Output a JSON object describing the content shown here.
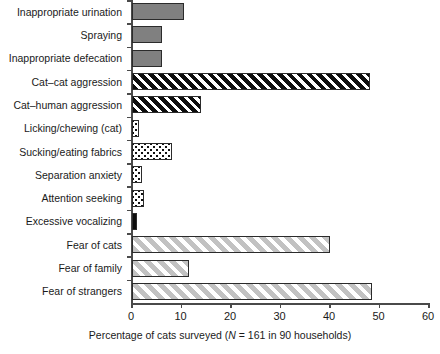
{
  "chart_data": {
    "type": "bar",
    "orientation": "horizontal",
    "title": "",
    "xlabel_prefix": "Percentage of cats surveyed (",
    "xlabel_italic": "N",
    "xlabel_suffix": " = 161 in 90 households)",
    "xlabel_full": "Percentage of cats surveyed (N = 161 in 90 households)",
    "ylabel": "",
    "xlim": [
      0,
      60
    ],
    "xticks": [
      0,
      10,
      20,
      30,
      40,
      50,
      60
    ],
    "xtick_labels": [
      "0",
      "10",
      "20",
      "30",
      "40",
      "50",
      "60"
    ],
    "grid": false,
    "legend": "none",
    "categories": [
      "Inappropriate urination",
      "Spraying",
      "Inappropriate defecation",
      "Cat–cat aggression",
      "Cat–human aggression",
      "Licking/chewing (cat)",
      "Sucking/eating fabrics",
      "Separation anxiety",
      "Attention seeking",
      "Excessive vocalizing",
      "Fear of cats",
      "Fear of family",
      "Fear of strangers"
    ],
    "values": [
      10.5,
      6.0,
      6.0,
      48.0,
      14.0,
      1.5,
      8.0,
      2.0,
      2.5,
      1.0,
      40.0,
      11.5,
      48.5
    ],
    "bar_patterns": [
      "solid-gray",
      "solid-gray",
      "solid-gray",
      "black-hatch",
      "black-hatch",
      "white-dots",
      "white-dots",
      "white-dots",
      "white-dots",
      "solid-black",
      "gray-hatch",
      "gray-hatch",
      "gray-hatch"
    ],
    "colors": {
      "solid_gray": "#808080",
      "black_hatch": "#0d0d0d",
      "white_dots": "#ffffff",
      "solid_black": "#0d0d0d",
      "gray_hatch": "#c2c2c2",
      "axis": "#4a4a4a",
      "border": "#2b2b2b",
      "background": "#ffffff",
      "text": "#1a1a1a"
    }
  }
}
